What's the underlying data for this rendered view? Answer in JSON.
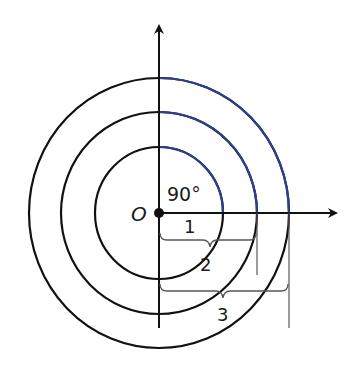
{
  "diagram": {
    "center_label": "O",
    "angle_label": "90°",
    "radius_labels": [
      "1",
      "2",
      "3"
    ],
    "colors": {
      "circle": "#111111",
      "arc_highlight": "#2b3f8f",
      "axis": "#111111",
      "brace": "#444444"
    },
    "circles": [
      {
        "radius": 1,
        "label": "1"
      },
      {
        "radius": 2,
        "label": "2"
      },
      {
        "radius": 3,
        "label": "3"
      }
    ]
  }
}
